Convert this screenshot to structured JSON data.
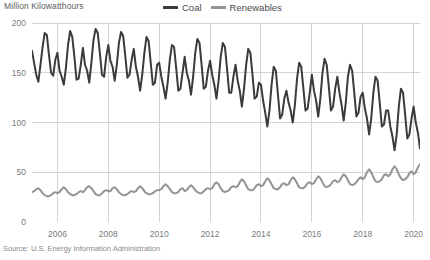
{
  "source_note": "Source: U.S. Energy Information Administration",
  "legend": {
    "position": "top-center",
    "items": [
      {
        "label": "Coal",
        "color": "#3b3b3b",
        "icon": "line-swatch-icon"
      },
      {
        "label": "Renewables",
        "color": "#949494",
        "icon": "line-swatch-icon"
      }
    ]
  },
  "chart_data": {
    "type": "line",
    "title": "",
    "subtitle": "",
    "xlabel": "",
    "ylabel": "Million Kilowatthours",
    "ylim": [
      0,
      200
    ],
    "yticks": [
      0,
      50,
      100,
      150,
      200
    ],
    "ytick_labels": [
      "0",
      "50",
      "100",
      "150",
      "200"
    ],
    "xlim": [
      2005.0,
      2020.25
    ],
    "xticks": [
      2006,
      2008,
      2010,
      2012,
      2014,
      2016,
      2018,
      2020
    ],
    "xtick_labels": [
      "2006",
      "2008",
      "2010",
      "2012",
      "2014",
      "2016",
      "2018",
      "2020"
    ],
    "grid": true,
    "grid_color": "#d4d4d4",
    "frequency": "monthly",
    "x_start": 2005.0,
    "x_step": 0.0833333,
    "series": [
      {
        "name": "Coal",
        "color": "#3b3b3b",
        "width": 2.0,
        "values": [
          172,
          160,
          148,
          141,
          158,
          176,
          190,
          188,
          168,
          150,
          147,
          163,
          170,
          152,
          146,
          138,
          155,
          178,
          192,
          186,
          166,
          143,
          144,
          158,
          175,
          158,
          152,
          140,
          160,
          183,
          194,
          190,
          170,
          148,
          146,
          166,
          178,
          162,
          156,
          142,
          158,
          180,
          191,
          187,
          167,
          145,
          148,
          163,
          174,
          156,
          146,
          132,
          148,
          170,
          186,
          182,
          160,
          138,
          140,
          158,
          160,
          146,
          136,
          124,
          140,
          163,
          178,
          176,
          155,
          132,
          134,
          150,
          166,
          150,
          142,
          128,
          146,
          170,
          184,
          180,
          158,
          134,
          136,
          152,
          162,
          148,
          138,
          124,
          142,
          166,
          180,
          176,
          154,
          130,
          130,
          146,
          158,
          142,
          132,
          116,
          134,
          158,
          174,
          170,
          148,
          124,
          126,
          140,
          138,
          122,
          110,
          96,
          112,
          138,
          156,
          152,
          128,
          104,
          108,
          124,
          132,
          120,
          112,
          100,
          118,
          144,
          160,
          156,
          134,
          112,
          114,
          130,
          148,
          132,
          122,
          106,
          124,
          150,
          164,
          158,
          136,
          112,
          116,
          134,
          146,
          130,
          118,
          102,
          120,
          146,
          158,
          152,
          130,
          106,
          110,
          126,
          130,
          114,
          104,
          88,
          104,
          130,
          146,
          142,
          120,
          96,
          98,
          112,
          112,
          96,
          86,
          72,
          88,
          116,
          134,
          130,
          108,
          84,
          88,
          104,
          116,
          100,
          90,
          74,
          92,
          120,
          138,
          132,
          110,
          84,
          86,
          100,
          104,
          88,
          78,
          64,
          80,
          108,
          124,
          118,
          96,
          72,
          74,
          88,
          88,
          74,
          64,
          52,
          66,
          94,
          112,
          106,
          84,
          60,
          62,
          74,
          76,
          62,
          52,
          42,
          40
        ]
      },
      {
        "name": "Renewables",
        "color": "#949494",
        "width": 2.0,
        "values": [
          30,
          31,
          33,
          34,
          32,
          29,
          27,
          26,
          26,
          27,
          29,
          30,
          29,
          30,
          33,
          35,
          33,
          30,
          28,
          27,
          27,
          28,
          30,
          31,
          30,
          32,
          35,
          36,
          34,
          31,
          28,
          27,
          27,
          29,
          31,
          32,
          31,
          31,
          34,
          35,
          33,
          30,
          28,
          27,
          27,
          28,
          30,
          31,
          30,
          31,
          34,
          36,
          34,
          31,
          29,
          28,
          28,
          29,
          31,
          32,
          32,
          33,
          36,
          38,
          36,
          33,
          30,
          29,
          29,
          30,
          33,
          34,
          31,
          32,
          35,
          37,
          35,
          32,
          30,
          29,
          29,
          31,
          33,
          34,
          33,
          34,
          38,
          40,
          38,
          34,
          31,
          30,
          31,
          32,
          35,
          36,
          35,
          36,
          40,
          43,
          41,
          37,
          33,
          32,
          32,
          34,
          37,
          38,
          36,
          37,
          41,
          44,
          42,
          38,
          34,
          33,
          33,
          35,
          38,
          39,
          37,
          38,
          42,
          45,
          43,
          39,
          35,
          34,
          34,
          36,
          39,
          40,
          38,
          39,
          43,
          46,
          44,
          40,
          36,
          35,
          36,
          38,
          41,
          42,
          40,
          41,
          45,
          48,
          46,
          42,
          38,
          37,
          38,
          40,
          43,
          45,
          43,
          45,
          50,
          53,
          50,
          45,
          41,
          40,
          41,
          43,
          47,
          48,
          46,
          48,
          53,
          56,
          53,
          48,
          44,
          42,
          43,
          45,
          49,
          51,
          48,
          50,
          55,
          58,
          55,
          50,
          45,
          44,
          45,
          47,
          51,
          52,
          49,
          51,
          56,
          59,
          56,
          51,
          46,
          45,
          46,
          48,
          52,
          53,
          50,
          52,
          57,
          60,
          57,
          52,
          47,
          46,
          47,
          50,
          54,
          55,
          52,
          54,
          58,
          57,
          50
        ]
      }
    ]
  }
}
